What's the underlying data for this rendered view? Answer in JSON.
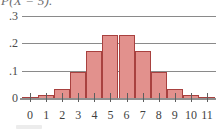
{
  "caption": {
    "partial_text": "P(X = 5)."
  },
  "chart_data": {
    "type": "bar",
    "title": "",
    "subtitle": "",
    "xlabel": "",
    "ylabel": "",
    "categories": [
      "0",
      "1",
      "2",
      "3",
      "4",
      "5",
      "6",
      "7",
      "8",
      "9",
      "10",
      "11"
    ],
    "values": [
      0.004,
      0.011,
      0.034,
      0.095,
      0.17,
      0.229,
      0.229,
      0.17,
      0.095,
      0.034,
      0.011,
      0.004
    ],
    "ylim": [
      0,
      0.32
    ],
    "xlim": [
      -0.5,
      11.5
    ],
    "ytick_labels": [
      "0",
      ".1",
      ".2",
      ".3"
    ],
    "ytick_values": [
      0,
      0.1,
      0.2,
      0.3
    ],
    "xtick_labels": [
      "0",
      "1",
      "2",
      "3",
      "4",
      "5",
      "6",
      "7",
      "8",
      "9",
      "10",
      "11"
    ],
    "grid": "horizontal",
    "legend": "none",
    "bar_fill_color": "#e2918d",
    "bar_border_color": "#a8413f",
    "gridline_color": "#8a8a8a",
    "axis_color": "#8f8f8f"
  }
}
